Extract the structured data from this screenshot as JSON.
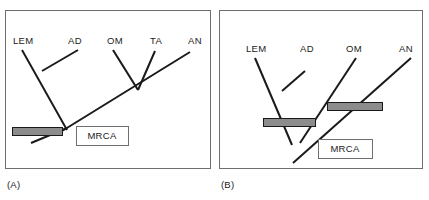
{
  "figure": {
    "type": "phylogenetic-tree-diagram",
    "background_color": "#ffffff",
    "line_color": "#1a1a1a",
    "bar_fill_color": "#8c8c8c",
    "bar_stroke_color": "#1a1a1a",
    "box_fill_color": "#ffffff",
    "box_stroke_color": "#6e6e6e",
    "panels": [
      {
        "id": "A",
        "caption": "(A)",
        "frame": {
          "x": 5,
          "y": 10,
          "width": 205,
          "height": 158
        },
        "taxa": [
          {
            "name": "LEM",
            "label_x": 13,
            "label_y": 44
          },
          {
            "name": "AD",
            "label_x": 68,
            "label_y": 44
          },
          {
            "name": "OM",
            "label_x": 107,
            "label_y": 44
          },
          {
            "name": "TA",
            "label_x": 150,
            "label_y": 44
          },
          {
            "name": "AN",
            "label_x": 188,
            "label_y": 44
          }
        ],
        "branches": [
          {
            "name": "root-stem",
            "x1": 31,
            "y1": 143,
            "x2": 67,
            "y2": 128
          },
          {
            "name": "backbone-to-anthropoid-node",
            "x1": 62,
            "y1": 131,
            "x2": 190,
            "y2": 52
          },
          {
            "name": "lemur-branch",
            "x1": 22,
            "y1": 50,
            "x2": 67,
            "y2": 130
          },
          {
            "name": "adapid-branch",
            "x1": 42,
            "y1": 71,
            "x2": 78,
            "y2": 50
          },
          {
            "name": "omomyid-branch",
            "x1": 113,
            "y1": 50,
            "x2": 138,
            "y2": 90
          },
          {
            "name": "tarsier-branch",
            "x1": 155,
            "y1": 51,
            "x2": 138,
            "y2": 90
          }
        ],
        "bars": [
          {
            "name": "mrca-bar",
            "x": 12,
            "y": 127,
            "width": 50,
            "height": 8,
            "rotation": 0
          }
        ],
        "boxes": [
          {
            "name": "mrca-box",
            "label": "MRCA",
            "x": 76,
            "y": 126,
            "width": 52,
            "height": 19
          }
        ]
      },
      {
        "id": "B",
        "caption": "(B)",
        "frame": {
          "x": 219,
          "y": 10,
          "width": 203,
          "height": 158
        },
        "taxa": [
          {
            "name": "LEM",
            "label_x": 246,
            "label_y": 52
          },
          {
            "name": "AD",
            "label_x": 300,
            "label_y": 52
          },
          {
            "name": "OM",
            "label_x": 346,
            "label_y": 52
          },
          {
            "name": "AN",
            "label_x": 399,
            "label_y": 52
          }
        ],
        "branches": [
          {
            "name": "lemur-branch",
            "x1": 255,
            "y1": 58,
            "x2": 292,
            "y2": 145
          },
          {
            "name": "adapid-branch",
            "x1": 282,
            "y1": 91,
            "x2": 305,
            "y2": 71
          },
          {
            "name": "backbone-root-to-anthropoid",
            "x1": 293,
            "y1": 163,
            "x2": 411,
            "y2": 58
          },
          {
            "name": "omomyid-branch",
            "x1": 356,
            "y1": 58,
            "x2": 300,
            "y2": 143
          }
        ],
        "bars": [
          {
            "name": "lemur-clade-bar",
            "x": 263,
            "y": 118,
            "width": 52,
            "height": 8,
            "rotation": 0
          },
          {
            "name": "anthropoid-clade-bar",
            "x": 327,
            "y": 102,
            "width": 55,
            "height": 8,
            "rotation": 0
          }
        ],
        "boxes": [
          {
            "name": "mrca-box",
            "label": "MRCA",
            "x": 318,
            "y": 139,
            "width": 54,
            "height": 19
          }
        ]
      }
    ]
  }
}
